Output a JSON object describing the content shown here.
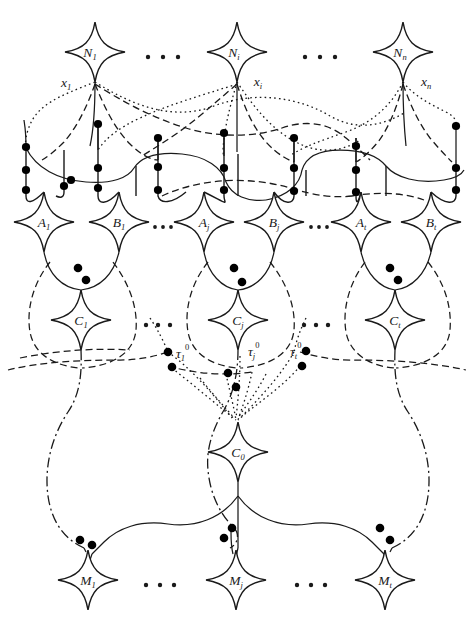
{
  "diagram": {
    "type": "graph-diagram",
    "background_color": "#ffffff",
    "stroke_color": "#1a1a1a",
    "vertex_color": "#000000",
    "rows": [
      {
        "name": "N-row",
        "y": 52,
        "nodes": [
          {
            "id": "N1",
            "label": "N",
            "sub": "1",
            "cx": 95,
            "cy": 52,
            "edge_label": "x",
            "edge_sub": "1",
            "edge_side": "left"
          },
          {
            "id": "Ni",
            "label": "N",
            "sub": "i",
            "cx": 237,
            "cy": 52,
            "edge_label": "x",
            "edge_sub": "i",
            "edge_side": "right"
          },
          {
            "id": "Nn",
            "label": "N",
            "sub": "n",
            "cx": 403,
            "cy": 52,
            "edge_label": "x",
            "edge_sub": "n",
            "edge_side": "right"
          }
        ],
        "ellipses": [
          {
            "cx": 164,
            "cy": 57
          },
          {
            "cx": 320,
            "cy": 57
          }
        ]
      },
      {
        "name": "AB-row",
        "y": 222,
        "nodes": [
          {
            "id": "A1",
            "label": "A",
            "sub": "1",
            "cx": 44,
            "cy": 222
          },
          {
            "id": "B1",
            "label": "B",
            "sub": "1",
            "cx": 119,
            "cy": 222
          },
          {
            "id": "Aj",
            "label": "A",
            "sub": "j",
            "cx": 204,
            "cy": 222
          },
          {
            "id": "Bj",
            "label": "B",
            "sub": "j",
            "cx": 274,
            "cy": 222
          },
          {
            "id": "At",
            "label": "A",
            "sub": "t",
            "cx": 361,
            "cy": 222
          },
          {
            "id": "Bt",
            "label": "B",
            "sub": "t",
            "cx": 431,
            "cy": 222
          }
        ],
        "ellipses": [
          {
            "cx": 162,
            "cy": 227
          },
          {
            "cx": 318,
            "cy": 227
          }
        ]
      },
      {
        "name": "C-row",
        "y": 320,
        "nodes": [
          {
            "id": "C1",
            "label": "C",
            "sub": "1",
            "cx": 81,
            "cy": 320
          },
          {
            "id": "Cj",
            "label": "C",
            "sub": "j",
            "cx": 238,
            "cy": 320
          },
          {
            "id": "Ct",
            "label": "C",
            "sub": "t",
            "cx": 395,
            "cy": 320
          }
        ],
        "ellipses": [
          {
            "cx": 158,
            "cy": 325
          },
          {
            "cx": 315,
            "cy": 325
          }
        ]
      },
      {
        "name": "C0-row",
        "y": 452,
        "nodes": [
          {
            "id": "C0",
            "label": "C",
            "sub": "0",
            "cx": 238,
            "cy": 452
          }
        ],
        "ellipses": []
      },
      {
        "name": "M-row",
        "y": 580,
        "nodes": [
          {
            "id": "M1",
            "label": "M",
            "sub": "1",
            "cx": 88,
            "cy": 580
          },
          {
            "id": "Mj",
            "label": "M",
            "sub": "j",
            "cx": 236,
            "cy": 580
          },
          {
            "id": "Mt",
            "label": "M",
            "sub": "t",
            "cx": 385,
            "cy": 580
          }
        ],
        "ellipses": [
          {
            "cx": 160,
            "cy": 585
          },
          {
            "cx": 310,
            "cy": 585
          }
        ]
      }
    ],
    "tau_labels": [
      {
        "id": "tau1",
        "label": "τ",
        "sub": "1",
        "sup": "0",
        "x": 176,
        "y": 358
      },
      {
        "id": "tauj",
        "label": "τ",
        "sub": "j",
        "sup": "0",
        "x": 248,
        "y": 356
      },
      {
        "id": "taut",
        "label": "τ",
        "sub": "t",
        "sup": "0",
        "x": 290,
        "y": 356
      }
    ],
    "line_styles": {
      "solid": "none",
      "dashed": "7,4",
      "dotted": "1.6,3.2",
      "dashdot": "10,3.5,2,3.5"
    }
  }
}
